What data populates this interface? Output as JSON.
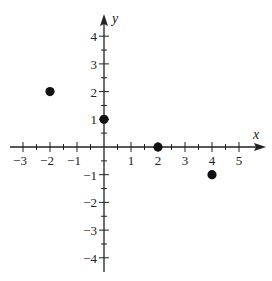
{
  "chart_data": {
    "type": "scatter",
    "title": "",
    "xlabel": "x",
    "ylabel": "y",
    "xlim": [
      -3.3,
      5.6
    ],
    "ylim": [
      -4.5,
      4.6
    ],
    "x_ticks_labeled": [
      -3,
      -2,
      -1,
      1,
      2,
      3,
      4,
      5
    ],
    "y_ticks_labeled": [
      -4,
      -3,
      -2,
      -1,
      1,
      2,
      3,
      4
    ],
    "minor_tick_step": 0.5,
    "grid": false,
    "legend": null,
    "points": [
      {
        "x": -2,
        "y": 2
      },
      {
        "x": 0,
        "y": 1
      },
      {
        "x": 2,
        "y": 0
      },
      {
        "x": 4,
        "y": -1
      }
    ],
    "colors": {
      "axis": "#222222",
      "point": "#111111",
      "background": "#ffffff"
    }
  }
}
